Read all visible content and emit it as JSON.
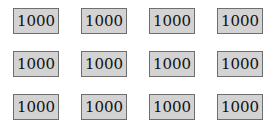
{
  "grid": {
    "rows": 3,
    "cols": 4,
    "cells": [
      [
        "1000",
        "1000",
        "1000",
        "1000"
      ],
      [
        "1000",
        "1000",
        "1000",
        "1000"
      ],
      [
        "1000",
        "1000",
        "1000",
        "1000"
      ]
    ]
  },
  "colors": {
    "cell_background": "#d3d3d3",
    "cell_border": "#6e6e6e",
    "page_background": "#ffffff"
  }
}
